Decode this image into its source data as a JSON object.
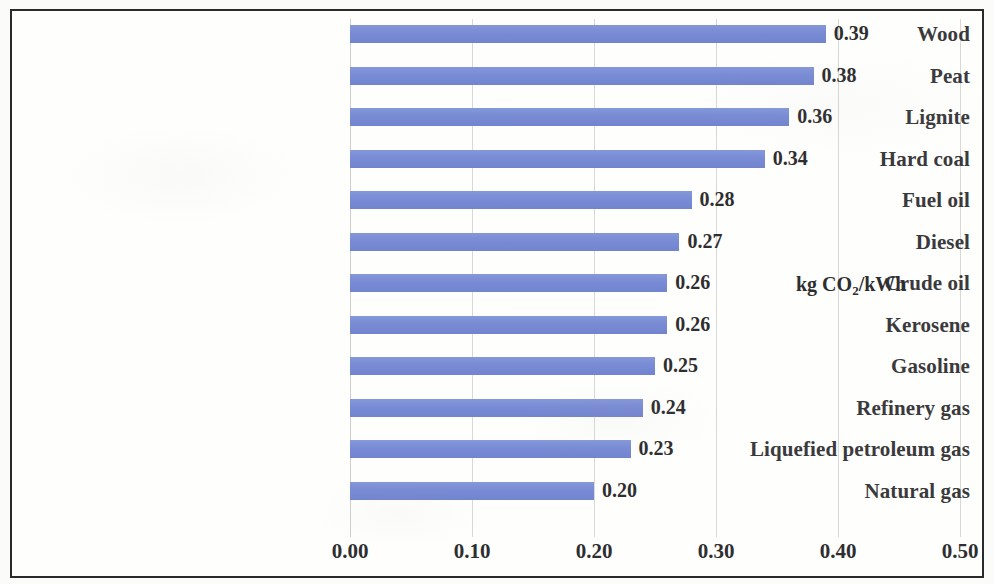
{
  "chart_data": {
    "type": "bar",
    "orientation": "horizontal",
    "title": "",
    "subtitle": "",
    "xlabel": "",
    "ylabel": "",
    "unit_label": "kg CO2/kWh",
    "unit_label_parts": {
      "prefix": "kg CO",
      "subscript": "2",
      "suffix": "/kWh"
    },
    "categories": [
      "Wood",
      "Peat",
      "Lignite",
      "Hard coal",
      "Fuel oil",
      "Diesel",
      "Crude oil",
      "Kerosene",
      "Gasoline",
      "Refinery gas",
      "Liquefied petroleum gas",
      "Natural gas"
    ],
    "values": [
      0.39,
      0.38,
      0.36,
      0.34,
      0.28,
      0.27,
      0.26,
      0.26,
      0.25,
      0.24,
      0.23,
      0.2
    ],
    "value_labels": [
      "0.39",
      "0.38",
      "0.36",
      "0.34",
      "0.28",
      "0.27",
      "0.26",
      "0.26",
      "0.25",
      "0.24",
      "0.23",
      "0.20"
    ],
    "xlim": [
      0.0,
      0.5
    ],
    "xticks": [
      0.0,
      0.1,
      0.2,
      0.3,
      0.4,
      0.5
    ],
    "xtick_labels": [
      "0.00",
      "0.10",
      "0.20",
      "0.30",
      "0.40",
      "0.50"
    ],
    "grid": {
      "vertical": true,
      "horizontal": false
    },
    "legend": {
      "visible": false,
      "position": "none"
    },
    "bar_color": "#7b8ed6",
    "text_color": "#2e2e30",
    "label_color": "#3a3a3c",
    "frame_color": "#2a2a2c",
    "background_color": "#fefefd",
    "gridline_color": "#d8d8d6"
  }
}
